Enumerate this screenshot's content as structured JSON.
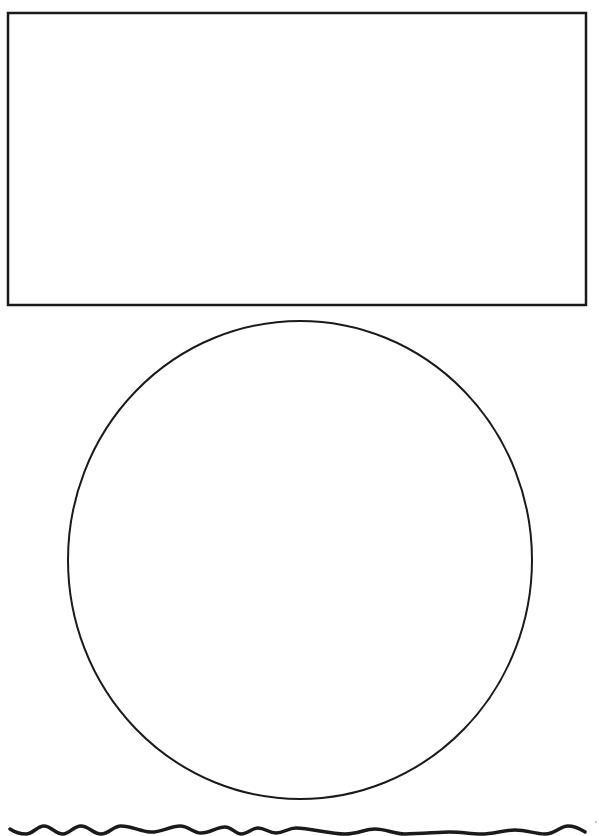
{
  "page": {
    "background": "#ffffff",
    "stroke_color": "#1a1a1a"
  },
  "shapes": {
    "rectangle": {
      "x": 8,
      "y": 13,
      "width": 578,
      "height": 292,
      "stroke_width": 2.5,
      "fill": "#ffffff"
    },
    "circle": {
      "cx": 300,
      "cy": 560,
      "rx": 232,
      "ry": 239,
      "stroke_width": 2,
      "fill": "#ffffff"
    },
    "wavy_line": {
      "stroke_width": 3.5,
      "path": "M10,829 C16,833 20,834 26,834 C33,834 37,826 44,826 C51,826 55,834 63,834 C70,834 73,826 81,826 C89,826 93,834 101,834 C109,834 113,826 121,826 C131,826 140,831 150,832 C160,833 170,826 180,826 C189,826 193,833 201,833 C211,833 216,827 225,827 C232,827 235,834 241,834 C248,834 252,828 258,828 C265,828 269,833 276,833 C284,833 288,828 296,828 C310,828 330,834 345,834 C358,834 365,829 375,829 C386,829 394,834 405,834 C420,834 440,832 450,832 C462,832 470,834 481,834 C494,834 503,830 515,830 C527,830 535,834 545,834 C555,834 560,826 568,826 C576,826 580,829 585,832"
    },
    "corner_mark": {
      "x": 596,
      "y": 822
    }
  }
}
